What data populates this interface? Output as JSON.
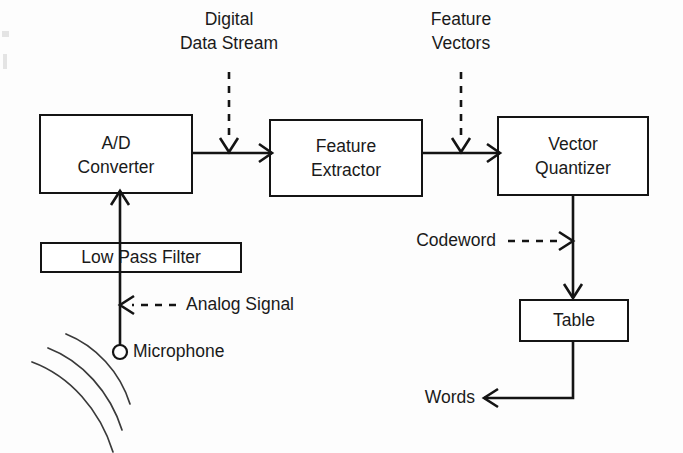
{
  "diagram": {
    "colors": {
      "background": "#fdfdfd",
      "stroke": "#141414",
      "text": "#1a1a1a",
      "wave": "#3a3a3a"
    },
    "nodes": [
      {
        "id": "ad-converter",
        "line1": "A/D",
        "line2": "Converter"
      },
      {
        "id": "feature-extractor",
        "line1": "Feature",
        "line2": "Extractor"
      },
      {
        "id": "vector-quantizer",
        "line1": "Vector",
        "line2": "Quantizer"
      },
      {
        "id": "low-pass-filter",
        "line1": "Low Pass Filter",
        "line2": ""
      },
      {
        "id": "table",
        "line1": "Table",
        "line2": ""
      }
    ],
    "annotations": [
      {
        "id": "digital-data-stream",
        "line1": "Digital",
        "line2": "Data Stream",
        "style": "dashed"
      },
      {
        "id": "feature-vectors",
        "line1": "Feature",
        "line2": "Vectors",
        "style": "dashed"
      },
      {
        "id": "codeword",
        "line1": "Codeword",
        "line2": "",
        "style": "dashed"
      },
      {
        "id": "analog-signal",
        "line1": "Analog Signal",
        "line2": "",
        "style": "dashed"
      },
      {
        "id": "microphone",
        "line1": "Microphone",
        "line2": "",
        "style": "none"
      },
      {
        "id": "words",
        "line1": "Words",
        "line2": "",
        "style": "solid"
      }
    ]
  }
}
